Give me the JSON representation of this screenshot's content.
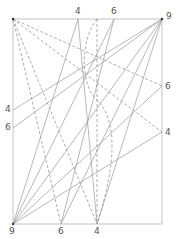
{
  "diagram": {
    "type": "crease-pattern",
    "frame": {
      "x1": 13,
      "y1": 19,
      "x2": 162,
      "y2": 224
    },
    "labels": [
      {
        "id": "top-4",
        "text": "4",
        "x": 75,
        "y": 7
      },
      {
        "id": "top-6",
        "text": "6",
        "x": 111,
        "y": 7
      },
      {
        "id": "top-right-9",
        "text": "9",
        "x": 166,
        "y": 12
      },
      {
        "id": "right-6",
        "text": "6",
        "x": 165,
        "y": 82
      },
      {
        "id": "right-4",
        "text": "4",
        "x": 165,
        "y": 128
      },
      {
        "id": "left-4",
        "text": "4",
        "x": 5,
        "y": 105
      },
      {
        "id": "left-6",
        "text": "6",
        "x": 5,
        "y": 123
      },
      {
        "id": "bottom-left-9",
        "text": "9",
        "x": 9,
        "y": 227
      },
      {
        "id": "bottom-6",
        "text": "6",
        "x": 58,
        "y": 227
      },
      {
        "id": "bottom-4",
        "text": "4",
        "x": 94,
        "y": 227
      }
    ],
    "points": {
      "TL": [
        13,
        19
      ],
      "TR": [
        162,
        19
      ],
      "BL": [
        13,
        224
      ],
      "BR": [
        162,
        224
      ],
      "T4": [
        78,
        19
      ],
      "T6": [
        114,
        19
      ],
      "R6": [
        162,
        86
      ],
      "R4": [
        162,
        132
      ],
      "L4": [
        13,
        110
      ],
      "L6": [
        13,
        128
      ],
      "B6": [
        61,
        224
      ],
      "B4": [
        97,
        224
      ]
    },
    "lines": [
      {
        "from": "TL",
        "to": "R6",
        "style": "dashed"
      },
      {
        "from": "TL",
        "to": "R4",
        "style": "dashed"
      },
      {
        "from": "TL",
        "to": "B6",
        "style": "dashed"
      },
      {
        "from": "TL",
        "to": "B4",
        "style": "dashed"
      },
      {
        "from": "TR",
        "to": "L4",
        "style": "solid"
      },
      {
        "from": "TR",
        "to": "L6",
        "style": "solid"
      },
      {
        "from": "TR",
        "to": "B6",
        "style": "solid"
      },
      {
        "from": "TR",
        "to": "B4",
        "style": "solid"
      },
      {
        "from": "TR",
        "to": "BL",
        "style": "solid"
      },
      {
        "from": "BL",
        "to": "T4",
        "style": "solid"
      },
      {
        "from": "BL",
        "to": "T6",
        "style": "solid"
      },
      {
        "from": "BL",
        "to": "R6",
        "style": "solid"
      },
      {
        "from": "BL",
        "to": "R4",
        "style": "solid"
      },
      {
        "from": "B4",
        "to": "T4",
        "style": "solid"
      },
      {
        "from": "B6",
        "to": "T6",
        "style": "solid"
      }
    ],
    "vertical_dashed_x": 97,
    "curve": "M97,19 C80,40 80,85 97,100 C118,120 116,165 97,224",
    "colors": {
      "frame": "#b0b0b0",
      "line": "#9a9a9a",
      "dashed": "#8a8a8a",
      "label": "#555555",
      "point": "#333333"
    }
  }
}
